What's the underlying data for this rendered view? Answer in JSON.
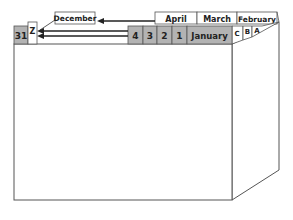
{
  "diagram": {
    "type": "card-file box with month and day divider tabs",
    "month_tabs_back": [
      "April",
      "March",
      "February"
    ],
    "month_tab_front": "January",
    "floating_label": "December",
    "day_tabs": [
      "4",
      "3",
      "2",
      "1"
    ],
    "day_tab_last": "31",
    "letter_tabs": [
      "C",
      "B",
      "A"
    ],
    "letter_tab_last": "Z",
    "colors": {
      "tab_fill": "#b3b3b3",
      "outline": "#444444",
      "background": "#ffffff"
    }
  }
}
